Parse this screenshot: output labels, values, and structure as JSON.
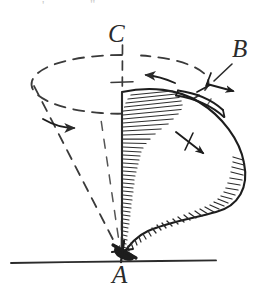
{
  "figure": {
    "kind": "hand-drawn mechanics diagram",
    "background_color": "#ffffff",
    "ink_color": "#2b2b2b",
    "width": 273,
    "height": 290
  },
  "labels": {
    "apex": "A",
    "rim_point": "B",
    "axis_top": "C"
  },
  "top_margin_artifacts": {
    "left_mark": "'",
    "right_mark": "\""
  },
  "elements": {
    "vertical_axis_name": "dashed-vertical-axis",
    "precession_circle_name": "dashed-precession-ellipse",
    "cone_body_name": "top-body",
    "ground_line_name": "ground-line",
    "pivot_name": "pivot-point",
    "precession_arrow_front": "precession-arrow-front",
    "precession_arrow_back": "precession-arrow-back",
    "spin_arrow": "spin-arrow-at-B",
    "radial_arrow": "radial-arrow"
  },
  "geometry": {
    "apex_xy": [
      122,
      257
    ],
    "axis_top_xy": [
      122,
      38
    ],
    "ellipse_center_xy": [
      122,
      128
    ],
    "ellipse_rx": 92,
    "ellipse_ry": 48,
    "ground_line": {
      "x1": 11,
      "y1": 262,
      "x2": 216,
      "y2": 261
    }
  }
}
